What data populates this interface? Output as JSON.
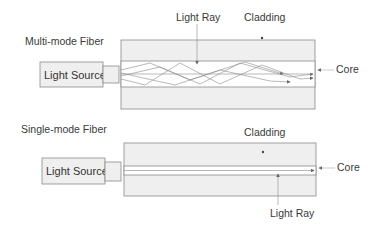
{
  "multimode": {
    "title": "Multi-mode Fiber",
    "source_label": "Light Source",
    "light_ray_label": "Light Ray",
    "cladding_label": "Cladding",
    "core_label": "Core"
  },
  "singlemode": {
    "title": "Single-mode Fiber",
    "source_label": "Light Source",
    "light_ray_label": "Light Ray",
    "cladding_label": "Cladding",
    "core_label": "Core"
  },
  "colors": {
    "cladding_fill": "#efefef",
    "core_fill": "#ffffff",
    "stroke": "#8a8a8a",
    "ray": "#888888"
  }
}
